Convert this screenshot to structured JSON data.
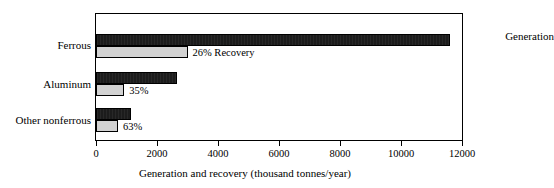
{
  "chart_data": {
    "type": "bar",
    "orientation": "horizontal",
    "title": "",
    "xlabel": "Generation and recovery (thousand tonnes/year)",
    "ylabel": "",
    "xlim": [
      0,
      12000
    ],
    "xticks": [
      0,
      2000,
      4000,
      6000,
      8000,
      10000,
      12000
    ],
    "xtick_labels": [
      "0",
      "2000",
      "4000",
      "6000",
      "8000",
      "10000",
      "12000"
    ],
    "grid": false,
    "legend_position": "inside-top-right",
    "categories": [
      "Ferrous",
      "Aluminum",
      "Other nonferrous"
    ],
    "series": [
      {
        "name": "Generation",
        "color": "#1c1c1c",
        "values": [
          11600,
          2650,
          1150
        ]
      },
      {
        "name": "Recovery",
        "color": "#d2d2d2",
        "values": [
          3000,
          930,
          720
        ]
      }
    ],
    "annotations": [
      {
        "text": "Generation",
        "category": "Ferrous",
        "series": "Generation"
      },
      {
        "text": "26% Recovery",
        "category": "Ferrous",
        "series": "Recovery",
        "percent": 26
      },
      {
        "text": "35%",
        "category": "Aluminum",
        "series": "Recovery",
        "percent": 35
      },
      {
        "text": "63%",
        "category": "Other nonferrous",
        "series": "Recovery",
        "percent": 63
      }
    ]
  },
  "chart": {
    "generation_legend": "Generation",
    "axis_title": "Generation and recovery (thousand tonnes/year)",
    "categories": [
      {
        "label": "Ferrous",
        "generation": 11600,
        "recovery": 3000,
        "annotation": "26% Recovery"
      },
      {
        "label": "Aluminum",
        "generation": 2650,
        "recovery": 930,
        "annotation": "35%"
      },
      {
        "label": "Other nonferrous",
        "generation": 1150,
        "recovery": 720,
        "annotation": "63%"
      }
    ],
    "xticks": [
      {
        "value": 0,
        "label": "0"
      },
      {
        "value": 2000,
        "label": "2000"
      },
      {
        "value": 4000,
        "label": "4000"
      },
      {
        "value": 6000,
        "label": "6000"
      },
      {
        "value": 8000,
        "label": "8000"
      },
      {
        "value": 10000,
        "label": "10000"
      },
      {
        "value": 12000,
        "label": "12000"
      }
    ],
    "colors": {
      "generation": "#1c1c1c",
      "recovery": "#d2d2d2",
      "frame": "#000000",
      "text": "#000000",
      "background": "#ffffff"
    }
  }
}
